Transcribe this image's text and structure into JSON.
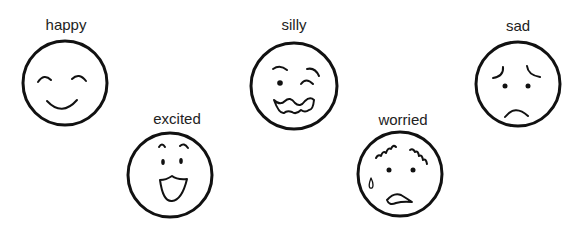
{
  "colors": {
    "ink": "#111111",
    "label": "#222222",
    "background": "#ffffff"
  },
  "faces": [
    {
      "id": "happy",
      "label": "happy",
      "icon": "happy-face-icon",
      "center": [
        65,
        83
      ],
      "radius": 43,
      "label_pos": [
        66,
        17
      ]
    },
    {
      "id": "excited",
      "label": "excited",
      "icon": "excited-face-icon",
      "center": [
        170,
        175
      ],
      "radius": 43,
      "label_pos": [
        177,
        111
      ]
    },
    {
      "id": "silly",
      "label": "silly",
      "icon": "silly-face-icon",
      "center": [
        294,
        86
      ],
      "radius": 44,
      "label_pos": [
        294,
        17
      ]
    },
    {
      "id": "worried",
      "label": "worried",
      "icon": "worried-face-icon",
      "center": [
        400,
        174
      ],
      "radius": 43,
      "label_pos": [
        403,
        112
      ]
    },
    {
      "id": "sad",
      "label": "sad",
      "icon": "sad-face-icon",
      "center": [
        518,
        84
      ],
      "radius": 43,
      "label_pos": [
        518,
        18
      ]
    }
  ]
}
